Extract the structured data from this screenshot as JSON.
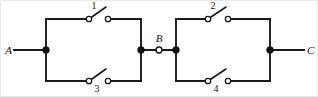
{
  "figure": {
    "kind": "circuit-diagram",
    "background_color": "#ffffff",
    "wire_color": "#1a1a1a",
    "frame_color": "#e9e9e9"
  },
  "terminals": [
    {
      "id": "A",
      "label": "A",
      "x": 46,
      "y": 50,
      "style": "filled-node",
      "lead_from_x": 14
    },
    {
      "id": "B",
      "label": "B",
      "x": 159,
      "y": 50,
      "style": "open-node"
    },
    {
      "id": "C",
      "label": "C",
      "x": 270,
      "y": 50,
      "style": "filled-node",
      "lead_to_x": 304
    }
  ],
  "junctions": [
    {
      "id": "left-right-node",
      "x": 141,
      "y": 50
    },
    {
      "id": "right-left-node",
      "x": 176,
      "y": 50
    }
  ],
  "switches": [
    {
      "id": "sw1",
      "label": "1",
      "state": "open",
      "branch": "left-upper",
      "pivot_x": 89,
      "contact_x": 108,
      "y": 19,
      "label_x": 94,
      "label_y": 9
    },
    {
      "id": "sw3",
      "label": "3",
      "state": "open",
      "branch": "left-lower",
      "pivot_x": 89,
      "contact_x": 108,
      "y": 81,
      "label_x": 96,
      "label_y": 92
    },
    {
      "id": "sw2",
      "label": "2",
      "state": "open",
      "branch": "right-upper",
      "pivot_x": 208,
      "contact_x": 228,
      "y": 19,
      "label_x": 213,
      "label_y": 9
    },
    {
      "id": "sw4",
      "label": "4",
      "state": "open",
      "branch": "right-lower",
      "pivot_x": 208,
      "contact_x": 228,
      "y": 81,
      "label_x": 215,
      "label_y": 92
    }
  ],
  "labels": {
    "terminal_a": "A",
    "terminal_b": "B",
    "terminal_c": "C",
    "switch_1": "1",
    "switch_2": "2",
    "switch_3": "3",
    "switch_4": "4"
  }
}
